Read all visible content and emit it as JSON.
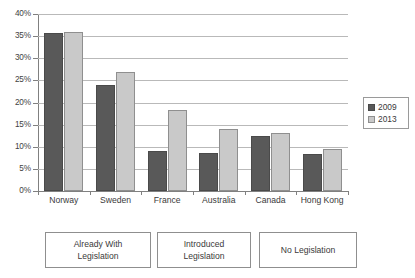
{
  "chart_data": {
    "type": "bar",
    "title": "",
    "subtitle": "",
    "xlabel": "",
    "ylabel": "",
    "categories": [
      "Norway",
      "Sweden",
      "France",
      "Australia",
      "Canada",
      "Hong Kong"
    ],
    "series": [
      {
        "name": "2009",
        "color": "#595959",
        "values": [
          35.7,
          23.9,
          9.0,
          8.5,
          12.4,
          8.3
        ]
      },
      {
        "name": "2013",
        "color": "#c9c9c9",
        "values": [
          36.0,
          27.0,
          18.2,
          14.0,
          13.2,
          9.4
        ]
      }
    ],
    "ylim": [
      0,
      40
    ],
    "ytick_values": [
      0,
      5,
      10,
      15,
      20,
      25,
      30,
      35,
      40
    ],
    "ytick_labels": [
      "0%",
      "5%",
      "10%",
      "15%",
      "20%",
      "25%",
      "30%",
      "35%",
      "40%"
    ],
    "grid": true,
    "grid_axis": "y",
    "legend_position": "right",
    "legend_entries": [
      "2009",
      "2013"
    ],
    "annotations": [
      {
        "label": "Already With\nLegislation",
        "covers": [
          "Norway",
          "Sweden"
        ]
      },
      {
        "label": "Introduced\nLegislation",
        "covers": [
          "France",
          "Australia"
        ]
      },
      {
        "label": "No Legislation",
        "covers": [
          "Canada",
          "Hong Kong"
        ]
      }
    ]
  },
  "group_boxes": [
    {
      "line1": "Already With",
      "line2": "Legislation"
    },
    {
      "line1": "Introduced",
      "line2": "Legislation"
    },
    {
      "line1": "No Legislation",
      "line2": ""
    }
  ],
  "colors": {
    "series_2009": "#595959",
    "series_2013": "#c9c9c9",
    "gridline": "#b9b9b9",
    "axis": "#808080",
    "text": "#3a3a3a",
    "background": "#ffffff"
  }
}
